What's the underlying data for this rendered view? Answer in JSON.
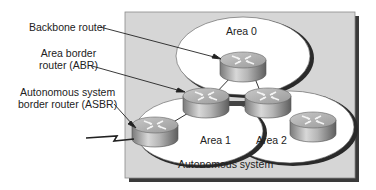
{
  "diagram": {
    "container": {
      "label": "Autonomous system",
      "fill": "#d6d6d6",
      "shadow": "#333333"
    },
    "areas": [
      {
        "id": "area0",
        "label": "Area 0"
      },
      {
        "id": "area1",
        "label": "Area 1"
      },
      {
        "id": "area2",
        "label": "Area 2"
      }
    ],
    "callouts": [
      {
        "id": "backbone",
        "lines": [
          "Backbone router"
        ]
      },
      {
        "id": "abr",
        "lines": [
          "Area border",
          "router (ABR)"
        ]
      },
      {
        "id": "asbr",
        "lines": [
          "Autonomous system",
          "border router (ASBR)"
        ]
      }
    ],
    "routers": [
      {
        "id": "backbone-router",
        "area": "Area 0"
      },
      {
        "id": "abr-area1",
        "area": "Area 0 / Area 1"
      },
      {
        "id": "abr-area2",
        "area": "Area 0 / Area 2"
      },
      {
        "id": "asbr-router",
        "area": "Area 1"
      },
      {
        "id": "area2-router",
        "area": "Area 2"
      }
    ],
    "external_link": "serial-lightning-link"
  }
}
